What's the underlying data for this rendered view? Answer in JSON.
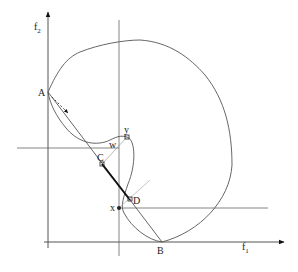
{
  "figure": {
    "type": "objective-space-diagram",
    "axes": {
      "x_label": "f",
      "x_label_sub": "1",
      "y_label": "f",
      "y_label_sub": "2"
    },
    "points": {
      "A": "A",
      "B": "B",
      "C": "C",
      "D": "D",
      "x": "x",
      "y": "y",
      "w": "w"
    },
    "colors": {
      "stroke": "#555555",
      "thick_segment": "#111111",
      "light_line": "#999999"
    }
  }
}
